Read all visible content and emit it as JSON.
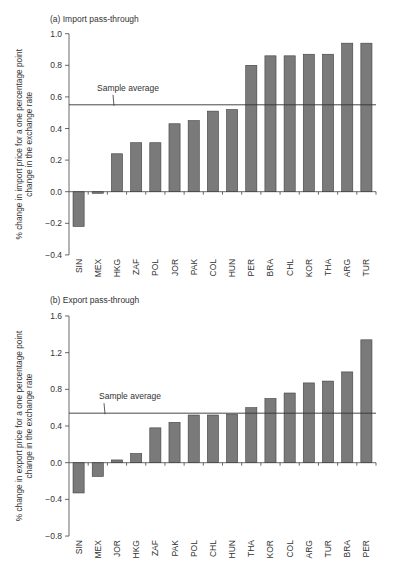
{
  "style": {
    "bar_fill": "#7a7a7a",
    "bar_stroke": "#3f3f3f",
    "axis_color": "#444444",
    "avg_line_color": "#333333"
  },
  "chart_data": [
    {
      "type": "bar",
      "title": "(a) Import pass-through",
      "xlabel": "",
      "ylabel": "% change in import price for a one percentage point change in the exchange rate",
      "ylabel_lines": [
        "% change in import price for a one percentage point",
        "change in the exchange rate"
      ],
      "ylim": [
        -0.4,
        1.0
      ],
      "yticks": [
        -0.4,
        -0.2,
        0.0,
        0.2,
        0.4,
        0.6,
        0.8,
        1.0
      ],
      "ytick_labels": [
        "−0.4",
        "−0.2",
        "0.0",
        "0.2",
        "0.4",
        "0.6",
        "0.8",
        "1.0"
      ],
      "grid": false,
      "legend": null,
      "categories": [
        "SIN",
        "MEX",
        "HKG",
        "ZAF",
        "POL",
        "JOR",
        "PAK",
        "COL",
        "HUN",
        "PER",
        "BRA",
        "CHL",
        "KOR",
        "THA",
        "ARG",
        "TUR"
      ],
      "values": [
        -0.22,
        -0.01,
        0.24,
        0.31,
        0.31,
        0.43,
        0.45,
        0.51,
        0.52,
        0.8,
        0.86,
        0.86,
        0.87,
        0.87,
        0.94,
        0.94
      ],
      "reference_line": {
        "label": "Sample average",
        "value": 0.55
      }
    },
    {
      "type": "bar",
      "title": "(b) Export pass-through",
      "xlabel": "",
      "ylabel": "% change in export price for a one percentage point change in the exchange rate",
      "ylabel_lines": [
        "% change in export price for a one percentage point",
        "change in the exchange rate"
      ],
      "ylim": [
        -0.8,
        1.6
      ],
      "yticks": [
        -0.8,
        -0.4,
        0.0,
        0.4,
        0.8,
        1.2,
        1.6
      ],
      "ytick_labels": [
        "−0.8",
        "−0.4",
        "0.0",
        "0.4",
        "0.8",
        "1.2",
        "1.6"
      ],
      "grid": false,
      "legend": null,
      "categories": [
        "SIN",
        "MEX",
        "JOR",
        "HKG",
        "ZAF",
        "PAK",
        "POL",
        "CHL",
        "HUN",
        "THA",
        "KOR",
        "COL",
        "ARG",
        "TUR",
        "BRA",
        "PER"
      ],
      "values": [
        -0.33,
        -0.15,
        0.03,
        0.1,
        0.38,
        0.44,
        0.52,
        0.52,
        0.53,
        0.6,
        0.7,
        0.76,
        0.87,
        0.89,
        0.99,
        1.34
      ],
      "reference_line": {
        "label": "Sample average",
        "value": 0.54
      }
    }
  ],
  "layout": {
    "panels": [
      {
        "plot_left": 69,
        "plot_right": 376,
        "zero_y": 191.7,
        "px_per_unit": 158,
        "title_x": 50,
        "title_y": 22,
        "ylabel_x": 22,
        "avg_label_x": 97,
        "avg_pointer_x": 114
      },
      {
        "plot_left": 69,
        "plot_right": 376,
        "zero_y": 462.7,
        "px_per_unit": 91.7,
        "title_x": 50,
        "title_y": 303,
        "ylabel_x": 22,
        "avg_label_x": 99,
        "avg_pointer_x": 105
      }
    ]
  }
}
